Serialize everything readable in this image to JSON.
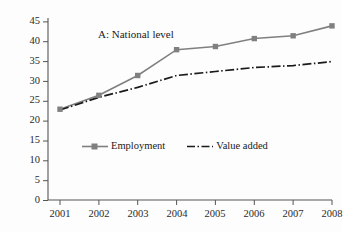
{
  "chart_data": {
    "type": "line",
    "title": "A: National level",
    "xlabel": "",
    "ylabel": "",
    "x": [
      "2001",
      "2002",
      "2003",
      "2004",
      "2005",
      "2006",
      "2007",
      "2008"
    ],
    "categories": [
      "2001",
      "2002",
      "2003",
      "2004",
      "2005",
      "2006",
      "2007",
      "2008"
    ],
    "series": [
      {
        "name": "Employment",
        "color": "#808080",
        "marker": "square",
        "linestyle": "solid",
        "values": [
          23.0,
          26.5,
          31.5,
          38.0,
          38.8,
          40.8,
          41.5,
          44.0
        ]
      },
      {
        "name": "Value added",
        "color": "#1a1a1a",
        "marker": "none",
        "linestyle": "dash-dot",
        "values": [
          22.8,
          26.0,
          28.5,
          31.5,
          32.5,
          33.5,
          34.0,
          35.0
        ]
      }
    ],
    "ylim": [
      0,
      47
    ],
    "yticks": [
      0,
      5,
      10,
      15,
      20,
      25,
      30,
      35,
      40,
      45
    ],
    "ytick_labels": [
      "0",
      "5",
      "10",
      "15",
      "20",
      "25",
      "30",
      "35",
      "40",
      "45"
    ],
    "xtick_labels": [
      "2001",
      "2002",
      "2003",
      "2004",
      "2005",
      "2006",
      "2007",
      "2008"
    ],
    "grid": false,
    "legend_position": "inside-bottom-center",
    "axis_color": "#555555",
    "background": "#fdfdfd"
  },
  "legend": {
    "entries": [
      {
        "label": "Employment"
      },
      {
        "label": "Value added"
      }
    ]
  },
  "axis": {
    "y_labels": [
      "45",
      "40",
      "35",
      "30",
      "25",
      "20",
      "15",
      "10",
      "5",
      "0"
    ],
    "x_labels": [
      "2001",
      "2002",
      "2003",
      "2004",
      "2005",
      "2006",
      "2007",
      "2008"
    ]
  },
  "title": {
    "text": "A: National level"
  }
}
